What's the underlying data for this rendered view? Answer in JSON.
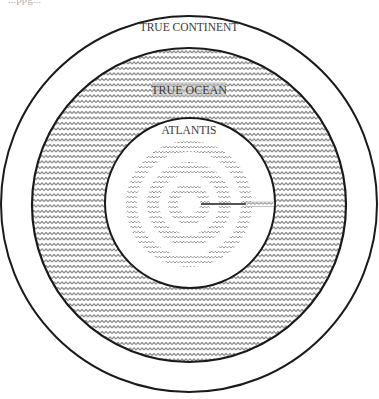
{
  "diagram": {
    "title_fragment": "...ppg...",
    "labels": {
      "outer": "TRUE CONTINENT",
      "ocean": "TRUE OCEAN",
      "center": "ATLANTIS"
    },
    "colors": {
      "line": "#1a1a1a",
      "hatch": "#6e6e6e",
      "background": "#ffffff"
    },
    "geometry": {
      "center": [
        189,
        204
      ],
      "true_continent_radius": 189,
      "true_ocean_radius": 158,
      "atlantis_radius": 85,
      "rings": [
        {
          "name": "ring-1",
          "outer": 63,
          "inner": 52
        },
        {
          "name": "ring-2",
          "outer": 42,
          "inner": 30
        },
        {
          "name": "ring-3",
          "outer": 21,
          "inner": 11
        }
      ],
      "canal": {
        "from_x": 200,
        "to_x": 274,
        "y": 204
      }
    }
  }
}
